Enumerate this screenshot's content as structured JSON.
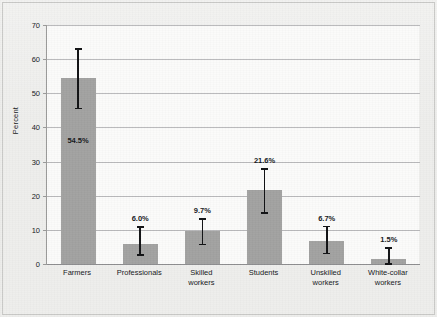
{
  "chart_data": {
    "type": "bar",
    "title": "",
    "xlabel": "",
    "ylabel": "Percent",
    "ylim": [
      0,
      70
    ],
    "yticks": [
      0,
      10,
      20,
      30,
      40,
      50,
      60,
      70
    ],
    "ytick_labels": [
      "0",
      "10",
      "20",
      "30",
      "40",
      "50",
      "60",
      "70"
    ],
    "grid": true,
    "legend": "none",
    "categories": [
      "Farmers",
      "Professionals",
      "Skilled workers",
      "Students",
      "Unskilled workers",
      "White-collar workers"
    ],
    "category_lines": [
      [
        "Farmers"
      ],
      [
        "Professionals"
      ],
      [
        "Skilled",
        "workers"
      ],
      [
        "Students"
      ],
      [
        "Unskilled",
        "workers"
      ],
      [
        "White-collar",
        "workers"
      ]
    ],
    "values": [
      54.5,
      6.0,
      9.7,
      21.6,
      6.7,
      1.5
    ],
    "value_labels": [
      "54.5%",
      "6.0%",
      "9.7%",
      "21.6%",
      "6.7%",
      "1.5%"
    ],
    "error_bars": {
      "lower": [
        45.8,
        2.9,
        6.0,
        15.2,
        3.3,
        0.2
      ],
      "upper": [
        63.2,
        11.1,
        13.5,
        28.0,
        11.2,
        5.0
      ]
    },
    "colors": {
      "bar_fill": "#a2a2a1",
      "error_bar": "#111214",
      "gridline": "#b9b9bb",
      "axis": "#8e8e90",
      "plot_background": "#fbfbfa",
      "figure_background": "#eeeeec",
      "text": "#15171a"
    }
  }
}
